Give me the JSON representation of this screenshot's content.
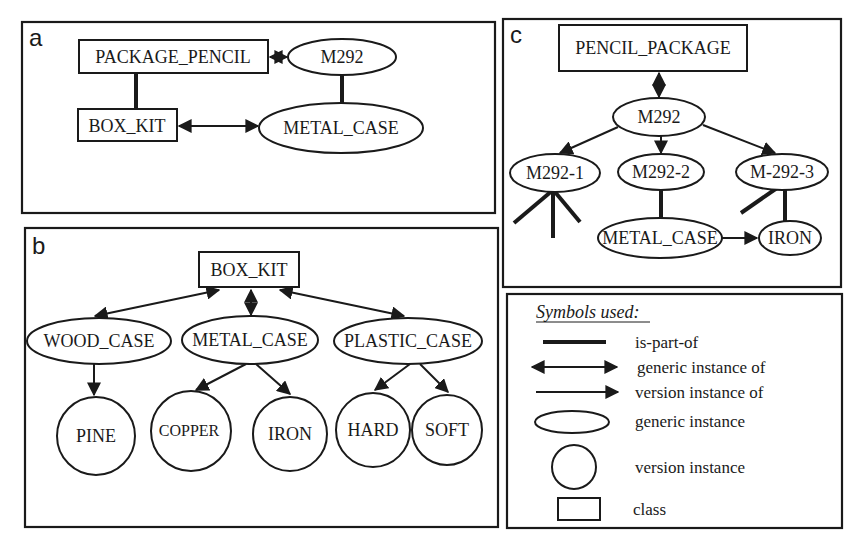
{
  "panels": {
    "a": {
      "letter": "a",
      "nodes": {
        "package_pencil": {
          "label": "PACKAGE_PENCIL",
          "kind": "class"
        },
        "m292": {
          "label": "M292",
          "kind": "generic instance"
        },
        "box_kit": {
          "label": "BOX_KIT",
          "kind": "class"
        },
        "metal_case": {
          "label": "METAL_CASE",
          "kind": "generic instance"
        }
      },
      "edges": [
        {
          "from": "PACKAGE_PENCIL",
          "to": "M292",
          "type": "generic instance of"
        },
        {
          "from": "PACKAGE_PENCIL",
          "to": "BOX_KIT",
          "type": "is-part-of"
        },
        {
          "from": "M292",
          "to": "METAL_CASE",
          "type": "is-part-of"
        },
        {
          "from": "BOX_KIT",
          "to": "METAL_CASE",
          "type": "generic instance of"
        }
      ]
    },
    "b": {
      "letter": "b",
      "nodes": {
        "box_kit": {
          "label": "BOX_KIT",
          "kind": "class"
        },
        "wood_case": {
          "label": "WOOD_CASE",
          "kind": "generic instance"
        },
        "metal_case": {
          "label": "METAL_CASE",
          "kind": "generic instance"
        },
        "plastic_case": {
          "label": "PLASTIC_CASE",
          "kind": "generic instance"
        },
        "pine": {
          "label": "PINE",
          "kind": "version instance"
        },
        "copper": {
          "label": "COPPER",
          "kind": "version instance"
        },
        "iron": {
          "label": "IRON",
          "kind": "version instance"
        },
        "hard": {
          "label": "HARD",
          "kind": "version instance"
        },
        "soft": {
          "label": "SOFT",
          "kind": "version instance"
        }
      },
      "edges": [
        {
          "from": "BOX_KIT",
          "to": "WOOD_CASE",
          "type": "generic instance of"
        },
        {
          "from": "BOX_KIT",
          "to": "METAL_CASE",
          "type": "generic instance of"
        },
        {
          "from": "BOX_KIT",
          "to": "PLASTIC_CASE",
          "type": "generic instance of"
        },
        {
          "from": "WOOD_CASE",
          "to": "PINE",
          "type": "version instance of"
        },
        {
          "from": "METAL_CASE",
          "to": "COPPER",
          "type": "version instance of"
        },
        {
          "from": "METAL_CASE",
          "to": "IRON",
          "type": "version instance of"
        },
        {
          "from": "PLASTIC_CASE",
          "to": "HARD",
          "type": "version instance of"
        },
        {
          "from": "PLASTIC_CASE",
          "to": "SOFT",
          "type": "version instance of"
        }
      ]
    },
    "c": {
      "letter": "c",
      "nodes": {
        "pencil_package": {
          "label": "PENCIL_PACKAGE",
          "kind": "class"
        },
        "m292": {
          "label": "M292",
          "kind": "generic instance"
        },
        "m292_1": {
          "label": "M292-1",
          "kind": "generic instance"
        },
        "m292_2": {
          "label": "M292-2",
          "kind": "generic instance"
        },
        "m292_3": {
          "label": "M-292-3",
          "kind": "generic instance"
        },
        "metal_case": {
          "label": "METAL_CASE",
          "kind": "generic instance"
        },
        "iron": {
          "label": "IRON",
          "kind": "generic instance"
        }
      },
      "edges": [
        {
          "from": "PENCIL_PACKAGE",
          "to": "M292",
          "type": "generic instance of"
        },
        {
          "from": "M292",
          "to": "M292-1",
          "type": "version instance of"
        },
        {
          "from": "M292",
          "to": "M292-2",
          "type": "version instance of"
        },
        {
          "from": "M292",
          "to": "M-292-3",
          "type": "version instance of"
        },
        {
          "from": "M292-2",
          "to": "METAL_CASE",
          "type": "is-part-of"
        },
        {
          "from": "M-292-3",
          "to": "IRON",
          "type": "is-part-of"
        },
        {
          "from": "METAL_CASE",
          "to": "IRON",
          "type": "version instance of"
        }
      ]
    }
  },
  "legend": {
    "title": "Symbols used:",
    "items": [
      {
        "symbol": "thick line",
        "label": "is-part-of"
      },
      {
        "symbol": "double-headed arrow",
        "label": "generic instance of"
      },
      {
        "symbol": "single-headed arrow",
        "label": "version instance of"
      },
      {
        "symbol": "ellipse",
        "label": "generic instance"
      },
      {
        "symbol": "circle",
        "label": "version instance"
      },
      {
        "symbol": "rectangle",
        "label": "class"
      }
    ]
  },
  "colors": {
    "ink": "#1a1a1a",
    "background": "#ffffff"
  }
}
